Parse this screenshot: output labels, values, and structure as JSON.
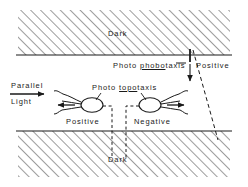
{
  "figure": {
    "background_color": "#ffffff",
    "ink_color": "#1a1a1a",
    "hatch_color": "#4a4a4a"
  },
  "regions": {
    "top_dark": {
      "label": "Dark",
      "fill": "diagonal-hatch",
      "x": 18,
      "y": 10,
      "width": 212,
      "height": 45
    },
    "bottom_dark": {
      "label": "Dark",
      "fill": "diagonal-hatch",
      "x": 18,
      "y": 131,
      "width": 212,
      "height": 46
    },
    "middle_light": {
      "label": "",
      "fill": "white"
    }
  },
  "labels": {
    "dark_top": "Dark",
    "dark_bottom": "Dark",
    "photo_phobotaxis_prefix": "Photo ",
    "photo_phobotaxis_root": "phobo",
    "photo_phobotaxis_suffix": "taxis",
    "photo_topotaxis_prefix": "Photo ",
    "photo_topotaxis_root": "topo",
    "photo_topotaxis_suffix": "taxis",
    "positive_right": "Positive",
    "positive_middle": "Positive",
    "negative_middle": "Negative",
    "parallel": "Parallel",
    "light": "Light"
  },
  "organisms": [
    {
      "name": "positive-phototactic-organism",
      "body_cx": 92,
      "body_cy": 105,
      "body_rx": 11,
      "body_ry": 7,
      "direction": "left",
      "response": "Positive"
    },
    {
      "name": "negative-phototactic-organism",
      "body_cx": 150,
      "body_cy": 105,
      "body_rx": 11,
      "body_ry": 7,
      "direction": "right",
      "response": "Negative"
    }
  ],
  "annotations": {
    "light_arrow_direction": "right",
    "phobotaxis_arrow_direction": "down",
    "leader_lines": 2,
    "dashed_vertical_lines": 2,
    "dashed_diagonal_line": 1
  }
}
